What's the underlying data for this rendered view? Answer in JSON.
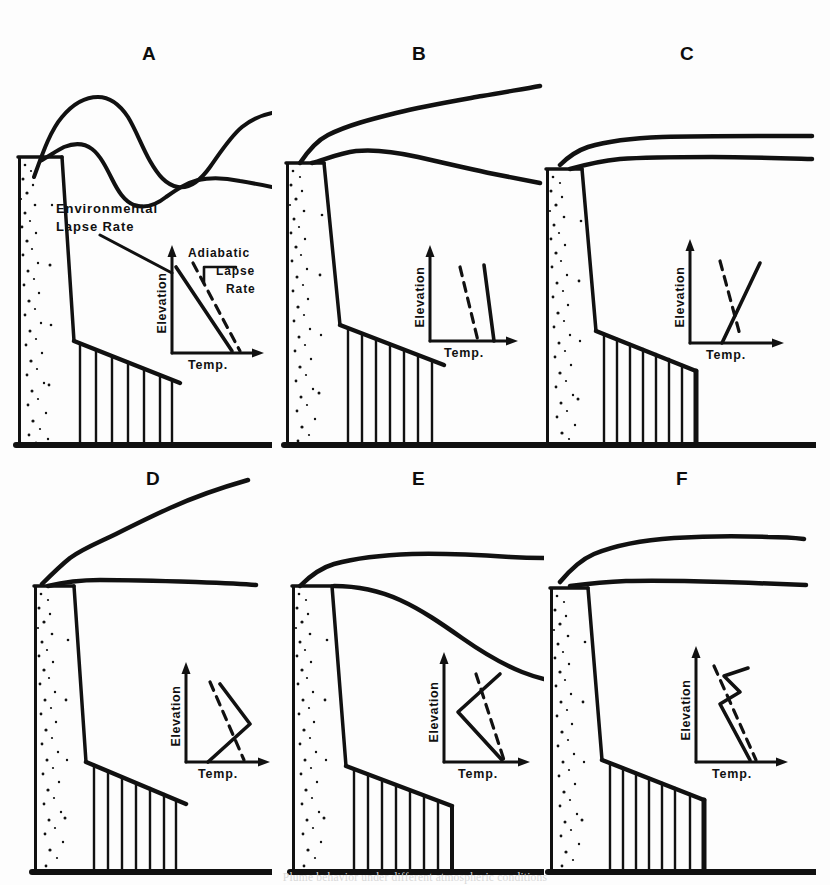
{
  "figure": {
    "title": "Plume behavior under different atmospheric conditions",
    "caption": "Plume behavior under different atmospheric conditions",
    "background_color": "#ffffff",
    "ink_color": "#111111",
    "width": 830,
    "height": 885
  },
  "annotations": {
    "environmental_lapse_rate": "Environmental\nLapse Rate",
    "environmental_lapse_rate_line1": "Environmental",
    "environmental_lapse_rate_line2": "Lapse Rate",
    "adiabatic_lapse_rate_line1": "Adiabatic",
    "adiabatic_lapse_rate_line2": "Lapse",
    "adiabatic_lapse_rate_line3": "Rate"
  },
  "inset_axes": {
    "y_label": "Elevation",
    "x_label": "Temp."
  },
  "panels": [
    {
      "id": "A",
      "label": "A",
      "plume_type": "looping",
      "stability": "unstable",
      "has_annotations": true,
      "inset": {
        "environmental_line": "steep-negative-solid",
        "adiabatic_line": "steep-negative-dashed",
        "description": "Environmental lapse rate steeper (to the left of) the dry adiabatic lapse rate; superadiabatic, unstable"
      }
    },
    {
      "id": "B",
      "label": "B",
      "plume_type": "coning",
      "stability": "neutral",
      "has_annotations": false,
      "inset": {
        "environmental_line": "near-vertical-solid-right",
        "adiabatic_line": "near-vertical-dashed-left",
        "description": "Environmental lapse rate nearly parallel to and slightly less than the adiabatic; neutral to slightly stable"
      }
    },
    {
      "id": "C",
      "label": "C",
      "plume_type": "fanning",
      "stability": "inversion (stable)",
      "has_annotations": false,
      "inset": {
        "environmental_line": "positive-slope-solid",
        "adiabatic_line": "negative-slope-dashed",
        "description": "Temperature increases with height (inversion); environmental line crosses the adiabatic"
      }
    },
    {
      "id": "D",
      "label": "D",
      "plume_type": "lofting",
      "stability": "inversion below, unstable above",
      "has_annotations": false,
      "inset": {
        "environmental_line": "inversion-below-lapse-above",
        "adiabatic_line": "steep-negative-dashed",
        "description": "Inversion near the surface with unstable layer aloft; plume lofts upward"
      }
    },
    {
      "id": "E",
      "label": "E",
      "plume_type": "fumigation",
      "stability": "unstable below, inversion above",
      "has_annotations": false,
      "inset": {
        "environmental_line": "lapse-below-inversion-above",
        "adiabatic_line": "steep-negative-dashed",
        "description": "Unstable layer below with inversion aloft; plume fumigates down to the ground"
      }
    },
    {
      "id": "F",
      "label": "F",
      "plume_type": "trapping",
      "stability": "inversion above and below",
      "has_annotations": false,
      "inset": {
        "environmental_line": "zigzag-about-adiabatic",
        "adiabatic_line": "negative-dashed",
        "description": "Elevated inversion traps the plume in a limited mixing layer"
      }
    }
  ]
}
